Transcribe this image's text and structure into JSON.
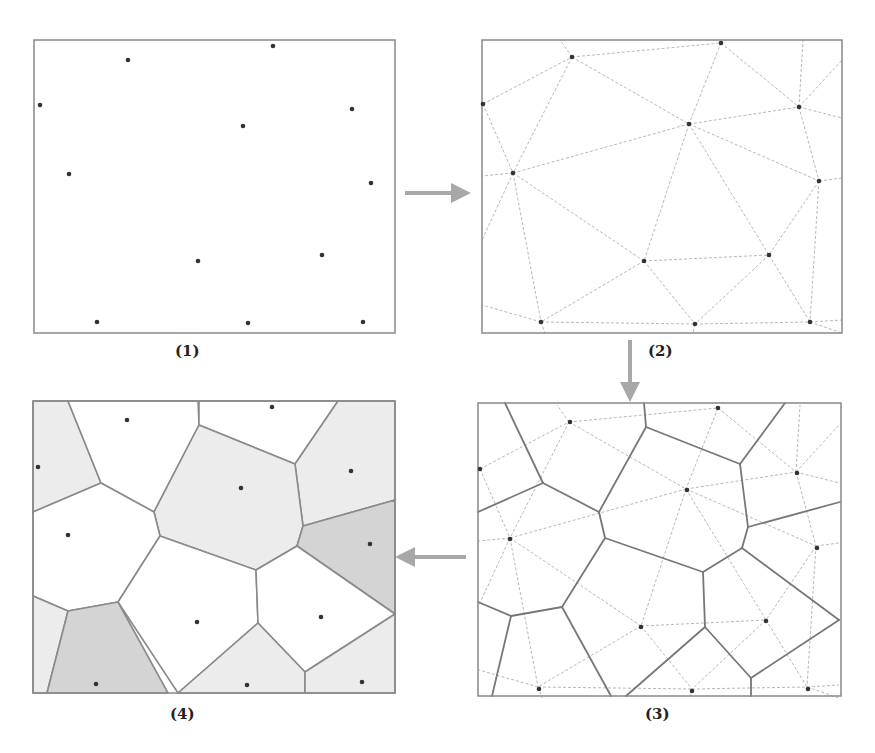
{
  "colors": {
    "frame": "#888888",
    "point": "#333333",
    "delaunay": "#b8b8b8",
    "voronoi": "#777777",
    "arrow": "#a8a8a8",
    "fill_light": "#ececec",
    "fill_dark": "#d4d4d4",
    "fill_white": "#ffffff"
  },
  "captions": {
    "p1": "(1)",
    "p2": "(2)",
    "p3": "(3)",
    "p4": "(4)"
  },
  "panels": [
    {
      "id": "p1",
      "label": "(1)",
      "description": "discrete sample points",
      "frame": [
        34,
        40,
        361,
        293
      ]
    },
    {
      "id": "p2",
      "label": "(2)",
      "description": "Delaunay triangulation",
      "frame": [
        482,
        40,
        360,
        293
      ]
    },
    {
      "id": "p3",
      "label": "(3)",
      "description": "Voronoi polygons over triangulation",
      "frame": [
        478,
        403,
        363,
        293
      ]
    },
    {
      "id": "p4",
      "label": "(4)",
      "description": "Thiessen polygons shaded",
      "frame": [
        33,
        401,
        362,
        292
      ]
    }
  ],
  "arrows": [
    {
      "from": "p1",
      "to": "p2",
      "direction": "right",
      "x1": 405,
      "y1": 193,
      "x2": 463,
      "y2": 193
    },
    {
      "from": "p2",
      "to": "p3",
      "direction": "down",
      "x1": 630,
      "y1": 340,
      "x2": 630,
      "y2": 394
    },
    {
      "from": "p3",
      "to": "p4",
      "direction": "left",
      "x1": 466,
      "y1": 557,
      "x2": 403,
      "y2": 557
    }
  ],
  "points": {
    "p1": [
      [
        40,
        105
      ],
      [
        128,
        60
      ],
      [
        273,
        46
      ],
      [
        243,
        126
      ],
      [
        352,
        109
      ],
      [
        69,
        174
      ],
      [
        371,
        183
      ],
      [
        198,
        261
      ],
      [
        322,
        255
      ],
      [
        97,
        322
      ],
      [
        248,
        323
      ],
      [
        363,
        322
      ]
    ],
    "p2": [
      [
        483,
        104
      ],
      [
        572,
        57
      ],
      [
        721,
        43
      ],
      [
        689,
        124
      ],
      [
        799,
        107
      ],
      [
        513,
        173
      ],
      [
        819,
        181
      ],
      [
        644,
        261
      ],
      [
        769,
        255
      ],
      [
        541,
        322
      ],
      [
        695,
        324
      ],
      [
        810,
        322
      ]
    ],
    "p3": [
      [
        480,
        469
      ],
      [
        570,
        422
      ],
      [
        718,
        408
      ],
      [
        687,
        490
      ],
      [
        797,
        473
      ],
      [
        510,
        539
      ],
      [
        817,
        548
      ],
      [
        641,
        627
      ],
      [
        766,
        621
      ],
      [
        539,
        689
      ],
      [
        692,
        691
      ],
      [
        808,
        689
      ]
    ],
    "p4": [
      [
        38,
        467
      ],
      [
        127,
        420
      ],
      [
        272,
        407
      ],
      [
        241,
        488
      ],
      [
        351,
        471
      ],
      [
        68,
        535
      ],
      [
        370,
        544
      ],
      [
        197,
        622
      ],
      [
        321,
        617
      ],
      [
        96,
        684
      ],
      [
        247,
        685
      ],
      [
        362,
        682
      ]
    ]
  },
  "delaunay_edges_p2": [
    [
      [
        483,
        104
      ],
      [
        572,
        57
      ]
    ],
    [
      [
        572,
        57
      ],
      [
        721,
        43
      ]
    ],
    [
      [
        483,
        104
      ],
      [
        513,
        173
      ]
    ],
    [
      [
        572,
        57
      ],
      [
        513,
        173
      ]
    ],
    [
      [
        572,
        57
      ],
      [
        689,
        124
      ]
    ],
    [
      [
        721,
        43
      ],
      [
        689,
        124
      ]
    ],
    [
      [
        721,
        43
      ],
      [
        799,
        107
      ]
    ],
    [
      [
        689,
        124
      ],
      [
        799,
        107
      ]
    ],
    [
      [
        513,
        173
      ],
      [
        689,
        124
      ]
    ],
    [
      [
        689,
        124
      ],
      [
        819,
        181
      ]
    ],
    [
      [
        799,
        107
      ],
      [
        819,
        181
      ]
    ],
    [
      [
        513,
        173
      ],
      [
        644,
        261
      ]
    ],
    [
      [
        689,
        124
      ],
      [
        644,
        261
      ]
    ],
    [
      [
        689,
        124
      ],
      [
        769,
        255
      ]
    ],
    [
      [
        644,
        261
      ],
      [
        769,
        255
      ]
    ],
    [
      [
        819,
        181
      ],
      [
        769,
        255
      ]
    ],
    [
      [
        819,
        181
      ],
      [
        810,
        322
      ]
    ],
    [
      [
        769,
        255
      ],
      [
        810,
        322
      ]
    ],
    [
      [
        513,
        173
      ],
      [
        541,
        322
      ]
    ],
    [
      [
        644,
        261
      ],
      [
        541,
        322
      ]
    ],
    [
      [
        644,
        261
      ],
      [
        695,
        324
      ]
    ],
    [
      [
        541,
        322
      ],
      [
        695,
        324
      ]
    ],
    [
      [
        769,
        255
      ],
      [
        695,
        324
      ]
    ],
    [
      [
        695,
        324
      ],
      [
        810,
        322
      ]
    ],
    [
      [
        799,
        107
      ],
      [
        803,
        40
      ]
    ],
    [
      [
        799,
        107
      ],
      [
        842,
        60
      ]
    ],
    [
      [
        799,
        107
      ],
      [
        842,
        118
      ]
    ],
    [
      [
        819,
        181
      ],
      [
        842,
        178
      ]
    ],
    [
      [
        513,
        173
      ],
      [
        482,
        240
      ]
    ],
    [
      [
        513,
        173
      ],
      [
        482,
        176
      ]
    ],
    [
      [
        483,
        104
      ],
      [
        482,
        104
      ]
    ],
    [
      [
        572,
        57
      ],
      [
        560,
        40
      ]
    ],
    [
      [
        541,
        322
      ],
      [
        482,
        305
      ]
    ],
    [
      [
        810,
        322
      ],
      [
        842,
        320
      ]
    ],
    [
      [
        810,
        322
      ],
      [
        842,
        333
      ]
    ],
    [
      [
        541,
        322
      ],
      [
        545,
        333
      ]
    ],
    [
      [
        695,
        324
      ],
      [
        693,
        333
      ]
    ]
  ],
  "voronoi_edges_p3": [
    [
      [
        505,
        403
      ],
      [
        543,
        483
      ]
    ],
    [
      [
        543,
        483
      ],
      [
        478,
        512
      ]
    ],
    [
      [
        543,
        483
      ],
      [
        599,
        512
      ]
    ],
    [
      [
        599,
        512
      ],
      [
        646,
        427
      ]
    ],
    [
      [
        646,
        427
      ],
      [
        644,
        403
      ]
    ],
    [
      [
        646,
        427
      ],
      [
        740,
        464
      ]
    ],
    [
      [
        740,
        464
      ],
      [
        785,
        403
      ]
    ],
    [
      [
        740,
        464
      ],
      [
        748,
        527
      ]
    ],
    [
      [
        748,
        527
      ],
      [
        840,
        502
      ]
    ],
    [
      [
        748,
        527
      ],
      [
        742,
        548
      ]
    ],
    [
      [
        742,
        548
      ],
      [
        703,
        572
      ]
    ],
    [
      [
        703,
        572
      ],
      [
        605,
        538
      ]
    ],
    [
      [
        605,
        538
      ],
      [
        599,
        512
      ]
    ],
    [
      [
        742,
        548
      ],
      [
        839,
        620
      ]
    ],
    [
      [
        703,
        572
      ],
      [
        705,
        627
      ]
    ],
    [
      [
        705,
        627
      ],
      [
        751,
        678
      ]
    ],
    [
      [
        751,
        678
      ],
      [
        839,
        620
      ]
    ],
    [
      [
        751,
        678
      ],
      [
        751,
        696
      ]
    ],
    [
      [
        705,
        627
      ],
      [
        626,
        696
      ]
    ],
    [
      [
        605,
        538
      ],
      [
        562,
        607
      ]
    ],
    [
      [
        562,
        607
      ],
      [
        511,
        616
      ]
    ],
    [
      [
        511,
        616
      ],
      [
        478,
        602
      ]
    ],
    [
      [
        511,
        616
      ],
      [
        492,
        696
      ]
    ],
    [
      [
        562,
        607
      ],
      [
        611,
        696
      ]
    ]
  ],
  "cells_p4": [
    {
      "shade": "light",
      "polygon": [
        [
          33,
          401
        ],
        [
          68,
          401
        ],
        [
          101,
          483
        ],
        [
          33,
          512
        ]
      ]
    },
    {
      "shade": "white",
      "polygon": [
        [
          68,
          401
        ],
        [
          198,
          401
        ],
        [
          199,
          425
        ],
        [
          154,
          512
        ],
        [
          101,
          483
        ]
      ]
    },
    {
      "shade": "white",
      "polygon": [
        [
          199,
          401
        ],
        [
          338,
          401
        ],
        [
          295,
          464
        ],
        [
          199,
          425
        ]
      ]
    },
    {
      "shade": "light",
      "polygon": [
        [
          338,
          401
        ],
        [
          395,
          401
        ],
        [
          395,
          500
        ],
        [
          303,
          526
        ],
        [
          295,
          464
        ]
      ]
    },
    {
      "shade": "light",
      "polygon": [
        [
          199,
          425
        ],
        [
          295,
          464
        ],
        [
          303,
          526
        ],
        [
          297,
          546
        ],
        [
          256,
          570
        ],
        [
          160,
          536
        ],
        [
          154,
          512
        ]
      ]
    },
    {
      "shade": "white",
      "polygon": [
        [
          33,
          512
        ],
        [
          101,
          483
        ],
        [
          154,
          512
        ],
        [
          160,
          536
        ],
        [
          118,
          602
        ],
        [
          68,
          611
        ],
        [
          33,
          596
        ]
      ]
    },
    {
      "shade": "dark",
      "polygon": [
        [
          303,
          526
        ],
        [
          395,
          500
        ],
        [
          395,
          614
        ],
        [
          297,
          546
        ]
      ]
    },
    {
      "shade": "white",
      "polygon": [
        [
          160,
          536
        ],
        [
          256,
          570
        ],
        [
          258,
          623
        ],
        [
          178,
          693
        ],
        [
          118,
          602
        ]
      ]
    },
    {
      "shade": "white",
      "polygon": [
        [
          256,
          570
        ],
        [
          297,
          546
        ],
        [
          395,
          614
        ],
        [
          305,
          672
        ],
        [
          258,
          623
        ]
      ]
    },
    {
      "shade": "light",
      "polygon": [
        [
          33,
          596
        ],
        [
          68,
          611
        ],
        [
          47,
          693
        ],
        [
          33,
          693
        ]
      ]
    },
    {
      "shade": "dark",
      "polygon": [
        [
          68,
          611
        ],
        [
          118,
          602
        ],
        [
          168,
          693
        ],
        [
          47,
          693
        ]
      ]
    },
    {
      "shade": "light",
      "polygon": [
        [
          258,
          623
        ],
        [
          305,
          672
        ],
        [
          305,
          693
        ],
        [
          178,
          693
        ]
      ]
    },
    {
      "shade": "light",
      "polygon": [
        [
          305,
          672
        ],
        [
          395,
          614
        ],
        [
          395,
          693
        ],
        [
          305,
          693
        ]
      ]
    }
  ],
  "caption_positions": {
    "p1": [
      175,
      342
    ],
    "p2": [
      648,
      342
    ],
    "p3": [
      645,
      705
    ],
    "p4": [
      170,
      705
    ]
  }
}
